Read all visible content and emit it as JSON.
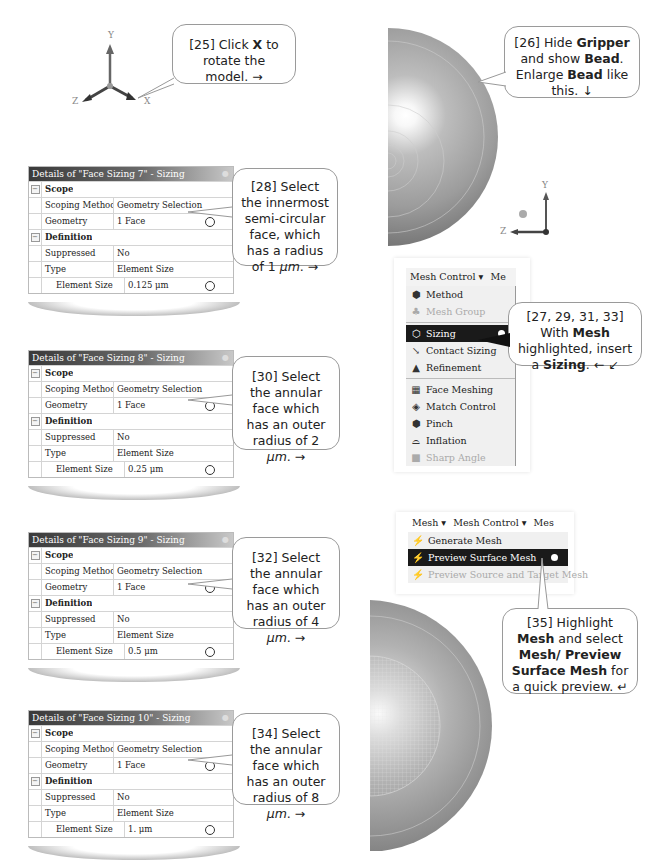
{
  "triad_top": {
    "x_label": "X",
    "y_label": "Y",
    "z_label": "Z"
  },
  "triad_bead": {
    "y_label": "Y",
    "z_label": "Z"
  },
  "callouts": {
    "c25": {
      "prefix": "[25] Click ",
      "bold": "X",
      "suffix": " to rotate the model. →"
    },
    "c26": {
      "p1": "[26] Hide ",
      "b1": "Gripper",
      "p2": " and show ",
      "b2": "Bead",
      "p3": ". Enlarge ",
      "b3": "Bead",
      "p4": " like this. ↓"
    },
    "c27": {
      "p1": "[27, 29, 31, 33] With ",
      "b1": "Mesh",
      "p2": " highlighted, insert a ",
      "b2": "Sizing",
      "p3": ". ← ↙"
    },
    "c28": {
      "text": "[28] Select the innermost semi-circular face, which has a radius of ",
      "value": "1 ",
      "unit": "μm",
      "suffix": ". →"
    },
    "c30": {
      "text": "[30] Select the annular face which has an outer radius of ",
      "value": "2 ",
      "unit": "μm",
      "suffix": ". →"
    },
    "c32": {
      "text": "[32] Select the annular face which has an outer radius of ",
      "value": "4 ",
      "unit": "μm",
      "suffix": ". →"
    },
    "c34": {
      "text": "[34] Select the annular face which has an outer radius of ",
      "value": "8 ",
      "unit": "μm",
      "suffix": ". →"
    },
    "c35": {
      "p1": "[35] Highlight ",
      "b1": "Mesh",
      "p2": " and select ",
      "b2": "Mesh/ Preview Surface Mesh",
      "p3": " for a quick preview. ↵"
    }
  },
  "panels": [
    {
      "title": "Details of \"Face Sizing 7\" - Sizing",
      "scope": "Scope",
      "scoping_method_label": "Scoping Method",
      "scoping_method": "Geometry Selection",
      "geometry_label": "Geometry",
      "geometry": "1 Face",
      "definition": "Definition",
      "suppressed_label": "Suppressed",
      "suppressed": "No",
      "type_label": "Type",
      "type": "Element Size",
      "element_size_label": "Element Size",
      "element_size": "0.125 μm"
    },
    {
      "title": "Details of \"Face Sizing 8\" - Sizing",
      "scope": "Scope",
      "scoping_method_label": "Scoping Method",
      "scoping_method": "Geometry Selection",
      "geometry_label": "Geometry",
      "geometry": "1 Face",
      "definition": "Definition",
      "suppressed_label": "Suppressed",
      "suppressed": "No",
      "type_label": "Type",
      "type": "Element Size",
      "element_size_label": "Element Size",
      "element_size": "0.25 μm"
    },
    {
      "title": "Details of \"Face Sizing 9\" - Sizing",
      "scope": "Scope",
      "scoping_method_label": "Scoping Method",
      "scoping_method": "Geometry Selection",
      "geometry_label": "Geometry",
      "geometry": "1 Face",
      "definition": "Definition",
      "suppressed_label": "Suppressed",
      "suppressed": "No",
      "type_label": "Type",
      "type": "Element Size",
      "element_size_label": "Element Size",
      "element_size": "0.5 μm"
    },
    {
      "title": "Details of \"Face Sizing 10\" - Sizing",
      "scope": "Scope",
      "scoping_method_label": "Scoping Method",
      "scoping_method": "Geometry Selection",
      "geometry_label": "Geometry",
      "geometry": "1 Face",
      "definition": "Definition",
      "suppressed_label": "Suppressed",
      "suppressed": "No",
      "type_label": "Type",
      "type": "Element Size",
      "element_size_label": "Element Size",
      "element_size": "1. μm"
    }
  ],
  "mesh_control_menu": {
    "toolbar": {
      "mesh_control": "Mesh Control ▾",
      "mesh_cut": "Me"
    },
    "items": [
      {
        "label": "Method",
        "icon": "method-icon",
        "glyph": "⬢",
        "disabled": false
      },
      {
        "label": "Mesh Group",
        "icon": "mesh-group-icon",
        "glyph": "♣",
        "disabled": true
      },
      {
        "label": "Sizing",
        "icon": "sizing-icon",
        "glyph": "⬡",
        "selected": true
      },
      {
        "label": "Contact Sizing",
        "icon": "contact-sizing-icon",
        "glyph": "↘"
      },
      {
        "label": "Refinement",
        "icon": "refinement-icon",
        "glyph": "▲"
      },
      {
        "label": "Face Meshing",
        "icon": "face-meshing-icon",
        "glyph": "▦"
      },
      {
        "label": "Match Control",
        "icon": "match-control-icon",
        "glyph": "◈"
      },
      {
        "label": "Pinch",
        "icon": "pinch-icon",
        "glyph": "⬢"
      },
      {
        "label": "Inflation",
        "icon": "inflation-icon",
        "glyph": "⌓"
      },
      {
        "label": "Sharp Angle",
        "icon": "sharp-angle-icon",
        "glyph": "■",
        "disabled": true
      }
    ]
  },
  "mesh_menu": {
    "toolbar": {
      "mesh": "Mesh ▾",
      "mesh_control": "Mesh Control ▾",
      "mesh_cut": "Mes"
    },
    "items": [
      {
        "label": "Generate Mesh",
        "icon": "generate-mesh-icon",
        "glyph": "⚡"
      },
      {
        "label": "Preview Surface Mesh",
        "icon": "preview-surface-mesh-icon",
        "glyph": "⚡",
        "selected": true
      },
      {
        "label": "Preview Source and Target Mesh",
        "icon": "preview-source-target-icon",
        "glyph": "⚡",
        "disabled": true
      }
    ]
  }
}
